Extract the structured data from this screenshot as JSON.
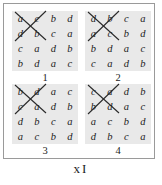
{
  "figure": {
    "caption": "x I",
    "caption_x": "x",
    "caption_i": "I",
    "border_color": "#9a9a9a",
    "panel_background": "#e9e9e9",
    "text_color": "#1c1c1c",
    "strikethrough_color": "#2a2a2a"
  },
  "panels": [
    {
      "label": "1",
      "name": "grid-panel-1",
      "struck_through": true,
      "rows": [
        [
          "a",
          "c",
          "b",
          "d"
        ],
        [
          "d",
          "b",
          "c",
          "a"
        ],
        [
          "c",
          "a",
          "d",
          "b"
        ],
        [
          "b",
          "d",
          "a",
          "c"
        ]
      ]
    },
    {
      "label": "2",
      "name": "grid-panel-2",
      "struck_through": true,
      "rows": [
        [
          "d",
          "b",
          "c",
          "a"
        ],
        [
          "a",
          "c",
          "b",
          "d"
        ],
        [
          "b",
          "d",
          "a",
          "c"
        ],
        [
          "c",
          "a",
          "d",
          "b"
        ]
      ]
    },
    {
      "label": "3",
      "name": "grid-panel-3",
      "struck_through": true,
      "rows": [
        [
          "b",
          "d",
          "a",
          "c"
        ],
        [
          "c",
          "a",
          "d",
          "b"
        ],
        [
          "d",
          "b",
          "c",
          "a"
        ],
        [
          "a",
          "c",
          "b",
          "d"
        ]
      ]
    },
    {
      "label": "4",
      "name": "grid-panel-4",
      "struck_through": true,
      "rows": [
        [
          "c",
          "a",
          "d",
          "b"
        ],
        [
          "b",
          "d",
          "a",
          "c"
        ],
        [
          "a",
          "c",
          "b",
          "d"
        ],
        [
          "d",
          "b",
          "c",
          "a"
        ]
      ]
    }
  ]
}
